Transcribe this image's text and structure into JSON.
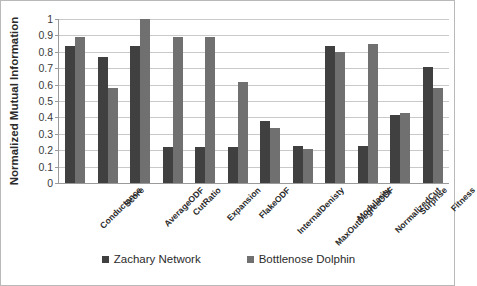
{
  "chart_data": {
    "type": "bar",
    "title": "",
    "xlabel": "",
    "ylabel": "Normalized Mutual Information",
    "ylim": [
      0,
      1
    ],
    "yticks": [
      "0",
      "0.1",
      "0.2",
      "0.3",
      "0.4",
      "0.5",
      "0.6",
      "0.7",
      "0.8",
      "0.9",
      "1"
    ],
    "grid": true,
    "legend_position": "bottom",
    "categories": [
      "Conductance",
      "Score",
      "AverageODF",
      "CutRatio",
      "Expansion",
      "FlakeODF",
      "InternalDenisty",
      "MaxOutDegreeODF",
      "Modularity",
      "NormalizedCut",
      "Surprise",
      "Fitness"
    ],
    "series": [
      {
        "name": "Zachary Network",
        "color": "#404040",
        "values": [
          0.835,
          0.77,
          0.835,
          0.22,
          0.22,
          0.22,
          0.38,
          0.225,
          0.835,
          0.225,
          0.415,
          0.705
        ]
      },
      {
        "name": "Bottlenose Dolphin",
        "color": "#707070",
        "values": [
          0.89,
          0.58,
          1.0,
          0.89,
          0.89,
          0.615,
          0.335,
          0.205,
          0.8,
          0.85,
          0.425,
          0.58
        ]
      }
    ]
  },
  "legend": {
    "items": [
      {
        "label": "Zachary Network",
        "color": "#404040"
      },
      {
        "label": "Bottlenose Dolphin",
        "color": "#707070"
      }
    ]
  }
}
